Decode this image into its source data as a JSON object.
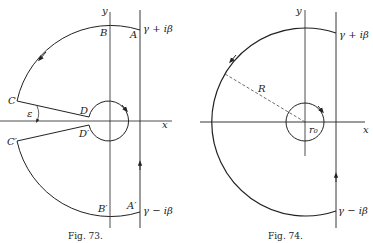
{
  "header_fragment": "(),  ...",
  "figures": [
    {
      "caption": "Fig. 73.",
      "labels": {
        "y_axis": "y",
        "x_axis": "x",
        "A": "A",
        "B": "B",
        "C": "C",
        "D": "D",
        "A_prime": "A′",
        "B_prime": "B′",
        "C_prime": "C′",
        "D_prime": "D′",
        "epsilon": "ε",
        "top_point": "γ + iβ",
        "bottom_point": "γ − iβ"
      }
    },
    {
      "caption": "Fig. 74.",
      "labels": {
        "y_axis": "y",
        "x_axis": "x",
        "radius": "R",
        "small_radius": "r₀",
        "top_point": "γ + iβ",
        "bottom_point": "γ − iβ"
      }
    }
  ],
  "colors": {
    "ink": "#222222",
    "background": "#ffffff"
  }
}
